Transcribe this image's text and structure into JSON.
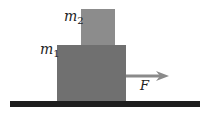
{
  "diagram": {
    "type": "stacked-blocks-force",
    "blocks": [
      {
        "id": "m2",
        "label_var": "m",
        "label_sub": "2",
        "color": "#8c8c8c",
        "position": "top"
      },
      {
        "id": "m1",
        "label_var": "m",
        "label_sub": "1",
        "color": "#707070",
        "position": "bottom"
      }
    ],
    "force": {
      "label": "F",
      "direction": "right",
      "color": "#8a8a8a",
      "applied_to": "m1"
    },
    "surface": {
      "color": "#1e1e1e"
    }
  }
}
